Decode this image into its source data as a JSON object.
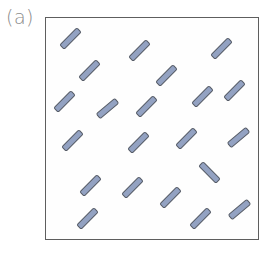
{
  "figure": {
    "panel_label": "(a)",
    "colors": {
      "rod_fill": "#93a2c2",
      "rod_border": "#555b66",
      "box_border": "#5e5e5e",
      "label": "#8a8a8a"
    },
    "rods": [
      {
        "x": 70,
        "y": 38,
        "angle": -45
      },
      {
        "x": 139,
        "y": 50,
        "angle": -45
      },
      {
        "x": 221,
        "y": 48,
        "angle": -45
      },
      {
        "x": 89,
        "y": 70,
        "angle": -45
      },
      {
        "x": 166,
        "y": 75,
        "angle": -45
      },
      {
        "x": 64,
        "y": 101,
        "angle": -45
      },
      {
        "x": 107,
        "y": 108,
        "angle": -40
      },
      {
        "x": 146,
        "y": 106,
        "angle": -45
      },
      {
        "x": 202,
        "y": 96,
        "angle": -45
      },
      {
        "x": 234,
        "y": 90,
        "angle": -45
      },
      {
        "x": 72,
        "y": 140,
        "angle": -45
      },
      {
        "x": 138,
        "y": 142,
        "angle": -45
      },
      {
        "x": 186,
        "y": 138,
        "angle": -45
      },
      {
        "x": 238,
        "y": 137,
        "angle": -40
      },
      {
        "x": 90,
        "y": 185,
        "angle": -45
      },
      {
        "x": 132,
        "y": 187,
        "angle": -45
      },
      {
        "x": 170,
        "y": 197,
        "angle": -45
      },
      {
        "x": 209,
        "y": 172,
        "angle": 45
      },
      {
        "x": 200,
        "y": 218,
        "angle": -45
      },
      {
        "x": 239,
        "y": 209,
        "angle": -40
      },
      {
        "x": 87,
        "y": 218,
        "angle": -45
      }
    ]
  }
}
